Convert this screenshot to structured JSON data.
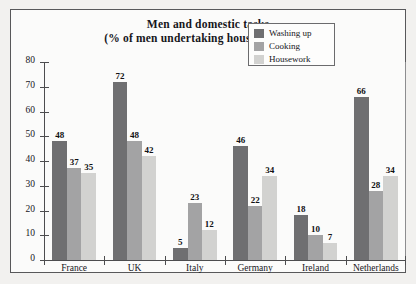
{
  "chart_data": {
    "type": "bar",
    "title": "Men and domestic tasks",
    "subtitle": "(% of men undertaking household work)",
    "xlabel": "",
    "ylabel": "",
    "ylim": [
      0,
      80
    ],
    "yticks": [
      0,
      10,
      20,
      30,
      40,
      50,
      60,
      70,
      80
    ],
    "grid": false,
    "legend_position": "top-right",
    "categories": [
      "France",
      "UK",
      "Italy",
      "Germany",
      "Ireland",
      "Netherlands"
    ],
    "series": [
      {
        "name": "Washing up",
        "color": "#6f6f71",
        "values": [
          48,
          72,
          5,
          46,
          18,
          66
        ]
      },
      {
        "name": "Cooking",
        "color": "#a3a3a4",
        "values": [
          37,
          48,
          23,
          22,
          10,
          28
        ]
      },
      {
        "name": "Housework",
        "color": "#d2d2d0",
        "values": [
          35,
          42,
          12,
          34,
          7,
          34
        ]
      }
    ]
  }
}
